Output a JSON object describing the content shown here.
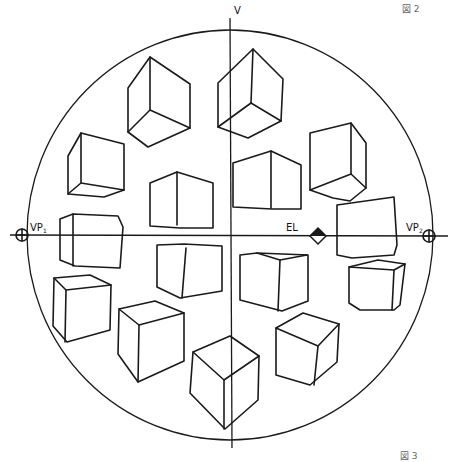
{
  "figures": {
    "top_label": "図 2",
    "bottom_label": "図 3"
  },
  "diagram": {
    "labels": {
      "vertical_axis": "V",
      "vanishing_point_left": "VP",
      "vanishing_point_left_sub": "1",
      "vanishing_point_right": "VP",
      "vanishing_point_right_sub": "2",
      "eye_level": "EL"
    },
    "cube_count": 15
  },
  "colors": {
    "ink": "#1a1a1a",
    "paper": "#ffffff",
    "caption": "#666666"
  }
}
